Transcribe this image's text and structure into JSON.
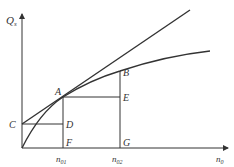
{
  "diagram": {
    "axes": {
      "y_label_main": "Q",
      "y_label_sub": "s",
      "x_label_main": "n",
      "x_label_sub": "0"
    },
    "points": {
      "A": "A",
      "B": "B",
      "C": "C",
      "D": "D",
      "E": "E",
      "F": "F",
      "G": "G"
    },
    "x_ticks": [
      {
        "main": "n",
        "sub": "01"
      },
      {
        "main": "n",
        "sub": "02"
      }
    ],
    "colors": {
      "line": "#333333",
      "background": "#ffffff"
    }
  }
}
